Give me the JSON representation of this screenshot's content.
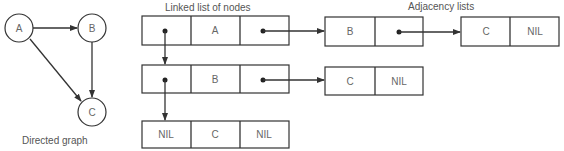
{
  "graph": {
    "caption": "Directed graph",
    "nodes": [
      {
        "label": "A"
      },
      {
        "label": "B"
      },
      {
        "label": "C"
      }
    ],
    "edges": [
      {
        "from": "A",
        "to": "B"
      },
      {
        "from": "A",
        "to": "C"
      },
      {
        "from": "B",
        "to": "C"
      }
    ]
  },
  "node_list": {
    "title": "Linked list of nodes",
    "rows": [
      {
        "next": "•",
        "name": "A",
        "adj": "•"
      },
      {
        "next": "•",
        "name": "B",
        "adj": "•"
      },
      {
        "next": "NIL",
        "name": "C",
        "adj": "NIL"
      }
    ]
  },
  "adjacency": {
    "title": "Adjacency lists",
    "lists": [
      {
        "owner": "A",
        "entries": [
          {
            "node": "B",
            "next": "•"
          },
          {
            "node": "C",
            "next": "NIL"
          }
        ]
      },
      {
        "owner": "B",
        "entries": [
          {
            "node": "C",
            "next": "NIL"
          }
        ]
      }
    ]
  },
  "colors": {
    "line": "#333333",
    "text": "#555555"
  }
}
